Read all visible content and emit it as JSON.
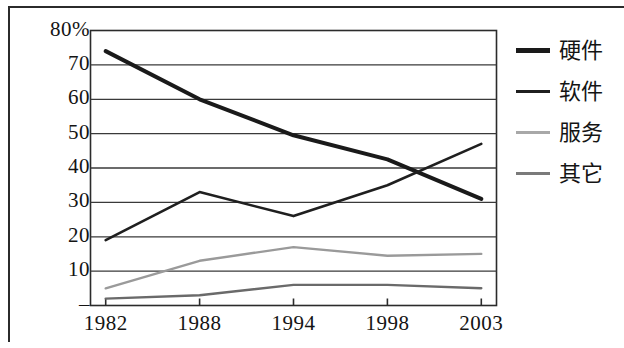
{
  "chart_data": {
    "type": "line",
    "title": "",
    "subtitle": "",
    "xlabel": "",
    "ylabel": "",
    "categories": [
      "1982",
      "1988",
      "1994",
      "1998",
      "2003"
    ],
    "x": [
      1982,
      1988,
      1994,
      1998,
      2003
    ],
    "ylim": [
      0,
      80
    ],
    "xlim": [
      1982,
      2003
    ],
    "y_ticks": [
      "80%",
      "70",
      "60",
      "50",
      "40",
      "30",
      "20",
      "10",
      "–"
    ],
    "y_tick_values": [
      80,
      70,
      60,
      50,
      40,
      30,
      20,
      10,
      0
    ],
    "x_ticks": [
      "1982",
      "1988",
      "1994",
      "1998",
      "2003"
    ],
    "grid": "horizontal",
    "legend_position": "right",
    "units": "percent",
    "series": [
      {
        "name": "硬件",
        "name_en": "hardware",
        "color": "#1a1a1a",
        "width": 4.0,
        "dash": "none",
        "values": [
          74,
          60,
          49.5,
          42.5,
          31
        ]
      },
      {
        "name": "软件",
        "name_en": "software",
        "color": "#1f1f1f",
        "width": 2.6,
        "dash": "none",
        "values": [
          19,
          33,
          26,
          35,
          47
        ]
      },
      {
        "name": "服务",
        "name_en": "services",
        "color": "#9a9a9a",
        "width": 2.4,
        "dash": "none",
        "values": [
          5,
          13,
          17,
          14.5,
          15
        ]
      },
      {
        "name": "其它",
        "name_en": "others",
        "color": "#6a6a6a",
        "width": 2.4,
        "dash": "none",
        "values": [
          2,
          3,
          6,
          6,
          5
        ]
      }
    ],
    "annotations": [
      "硬件 declines steadily from 74% in 1982 to 31% in 2003",
      "软件 rises from 19% in 1982 to 47% in 2003, crossing 硬件 near 40% between 1998 and 2003"
    ]
  },
  "legend": {
    "items": [
      {
        "label": "硬件",
        "color": "#1a1a1a",
        "thickness": "5px"
      },
      {
        "label": "软件",
        "color": "#1f1f1f",
        "thickness": "3px"
      },
      {
        "label": "服务",
        "color": "#a8a8a8",
        "thickness": "3px"
      },
      {
        "label": "其它",
        "color": "#7a7a7a",
        "thickness": "3px"
      }
    ]
  },
  "axes": {
    "y_labels": [
      "80%",
      "70",
      "60",
      "50",
      "40",
      "30",
      "20",
      "10",
      "–"
    ],
    "x_labels": [
      "1982",
      "1988",
      "1994",
      "1998",
      "2003"
    ]
  },
  "colors": {
    "ink": "#1a1a1a",
    "grid": "#3a3a3a",
    "frame": "#2b2b2b",
    "background": "#ffffff",
    "series_services": "#9a9a9a",
    "series_others": "#6a6a6a"
  }
}
